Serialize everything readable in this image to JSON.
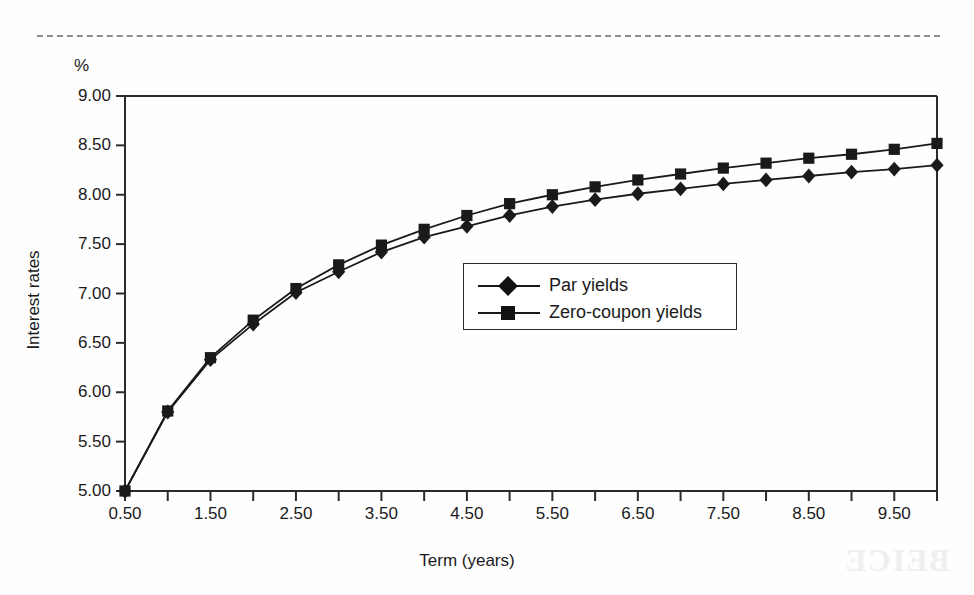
{
  "figure": {
    "unit_label": "%",
    "y_axis_title": "Interest rates",
    "x_axis_title": "Term (years)"
  },
  "legend": {
    "items": [
      {
        "label": "Par yields",
        "marker": "diamond-marker"
      },
      {
        "label": "Zero-coupon yields",
        "marker": "square-marker"
      }
    ]
  },
  "chart_data": {
    "type": "line",
    "title": "",
    "xlabel": "Term (years)",
    "ylabel": "Interest rates",
    "yunit": "%",
    "xlim": [
      0.5,
      10.0
    ],
    "ylim": [
      5.0,
      9.0
    ],
    "grid": false,
    "legend_position": "center-right",
    "x_major_tick_labels": [
      "0.50",
      "1.50",
      "2.50",
      "3.50",
      "4.50",
      "5.50",
      "6.50",
      "7.50",
      "8.50",
      "9.50"
    ],
    "y_tick_labels": [
      "5.00",
      "5.50",
      "6.00",
      "6.50",
      "7.00",
      "7.50",
      "8.00",
      "8.50",
      "9.00"
    ],
    "x_tick_step": 0.5,
    "x": [
      0.5,
      1.0,
      1.5,
      2.0,
      2.5,
      3.0,
      3.5,
      4.0,
      4.5,
      5.0,
      5.5,
      6.0,
      6.5,
      7.0,
      7.5,
      8.0,
      8.5,
      9.0,
      9.5,
      10.0
    ],
    "series": [
      {
        "name": "Par yields",
        "marker": "diamond",
        "values": [
          5.0,
          5.8,
          6.33,
          6.69,
          7.01,
          7.22,
          7.42,
          7.57,
          7.68,
          7.79,
          7.88,
          7.95,
          8.01,
          8.06,
          8.11,
          8.15,
          8.19,
          8.23,
          8.26,
          8.3
        ]
      },
      {
        "name": "Zero-coupon yields",
        "marker": "square",
        "values": [
          5.0,
          5.81,
          6.35,
          6.73,
          7.05,
          7.29,
          7.49,
          7.65,
          7.79,
          7.91,
          8.0,
          8.08,
          8.15,
          8.21,
          8.27,
          8.32,
          8.37,
          8.41,
          8.46,
          8.52
        ]
      }
    ]
  },
  "colors": {
    "ink": "#1a1a1a",
    "axis": "#2b2b2b",
    "rule": "#8e8e8e",
    "background": "#fefefe"
  },
  "bleed_text": "BEICE"
}
